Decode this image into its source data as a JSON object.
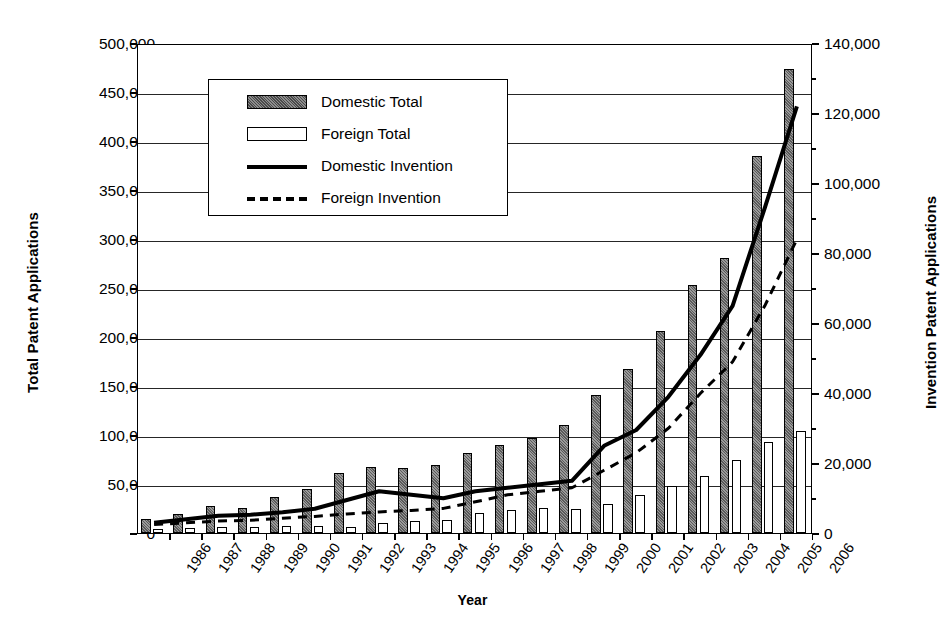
{
  "chart_data": {
    "type": "bar",
    "title": "",
    "xlabel": "Year",
    "ylabel": "Total Patent Applications",
    "y2label": "Invention Patent Applications",
    "grid": true,
    "legend_position": "upper-left-inside",
    "ylim": [
      0,
      500000
    ],
    "y2lim": [
      0,
      140000
    ],
    "yticks": [
      "0",
      "50,000",
      "100,000",
      "150,000",
      "200,000",
      "250,000",
      "300,000",
      "350,000",
      "400,000",
      "450,000",
      "500,000"
    ],
    "y2ticks": [
      "0",
      "20,000",
      "40,000",
      "60,000",
      "80,000",
      "100,000",
      "120,000",
      "140,000"
    ],
    "categories": [
      "1986",
      "1987",
      "1988",
      "1989",
      "1990",
      "1991",
      "1992",
      "1993",
      "1994",
      "1995",
      "1996",
      "1997",
      "1998",
      "1999",
      "2000",
      "2001",
      "2002",
      "2003",
      "2004",
      "2005",
      "2006"
    ],
    "series": [
      {
        "name": "Domestic Total",
        "axis": "left",
        "kind": "bar",
        "values": [
          14000,
          19000,
          28000,
          26000,
          37000,
          45000,
          61000,
          67000,
          66000,
          69000,
          82000,
          90000,
          97000,
          110000,
          141000,
          167000,
          206000,
          253000,
          281000,
          385000,
          473000
        ]
      },
      {
        "name": "Foreign Total",
        "axis": "left",
        "kind": "bar",
        "values": [
          4000,
          5000,
          6000,
          6000,
          7000,
          7000,
          6000,
          10000,
          12000,
          13000,
          20000,
          23000,
          26000,
          25000,
          30000,
          39000,
          48000,
          58000,
          75000,
          93000,
          104000
        ]
      },
      {
        "name": "Domestic Invention",
        "axis": "right",
        "kind": "line",
        "values": [
          3500,
          4500,
          5500,
          5800,
          6500,
          7500,
          10000,
          12500,
          11500,
          10500,
          12500,
          13500,
          14500,
          15500,
          25500,
          30000,
          39500,
          51500,
          65500,
          93500,
          122500
        ]
      },
      {
        "name": "Foreign Invention",
        "axis": "right",
        "kind": "line-dashed",
        "values": [
          3000,
          3500,
          4000,
          4200,
          4800,
          5300,
          6000,
          6600,
          7000,
          7600,
          9500,
          11500,
          12500,
          13500,
          18500,
          23500,
          30500,
          40500,
          49500,
          65500,
          84500
        ]
      }
    ]
  },
  "legend": {
    "items": [
      {
        "label": "Domestic Total",
        "key": "swatch-hatched"
      },
      {
        "label": "Foreign Total",
        "key": "swatch-white"
      },
      {
        "label": "Domestic Invention",
        "key": "line-solid"
      },
      {
        "label": "Foreign Invention",
        "key": "line-dashed"
      }
    ]
  }
}
